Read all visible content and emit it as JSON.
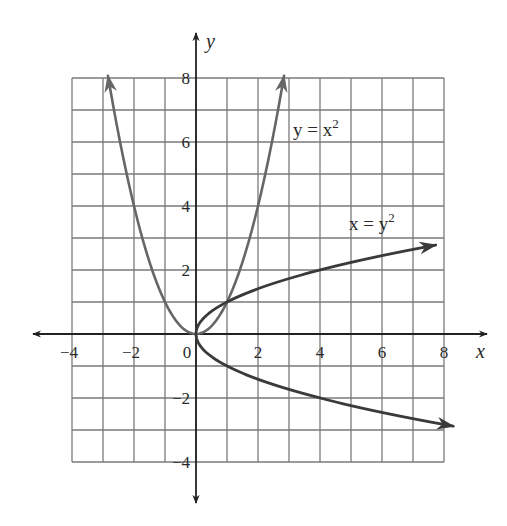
{
  "chart_data": {
    "type": "line",
    "title": "",
    "xlabel": "x",
    "ylabel": "y",
    "xlim": [
      -4,
      8
    ],
    "ylim": [
      -4,
      8
    ],
    "grid": true,
    "grid_step": 1,
    "x_ticks": [
      -4,
      -2,
      0,
      2,
      4,
      6,
      8
    ],
    "x_tick_labels": [
      "−4",
      "−2",
      "0",
      "2",
      "4",
      "6",
      "8"
    ],
    "y_ticks": [
      -4,
      -2,
      2,
      4,
      6,
      8
    ],
    "y_tick_labels": [
      "−4",
      "−2",
      "2",
      "4",
      "6",
      "8"
    ],
    "series": [
      {
        "name": "y = x^2",
        "label_main": "y = x",
        "label_sup": "2",
        "param": "x",
        "domain": [
          -2.84,
          2.84
        ],
        "color": "#666666",
        "arrows": "both-ends",
        "sample_points": [
          [
            -2.84,
            8.07
          ],
          [
            -2,
            4
          ],
          [
            -1,
            1
          ],
          [
            0,
            0
          ],
          [
            1,
            1
          ],
          [
            2,
            4
          ],
          [
            2.84,
            8.07
          ]
        ]
      },
      {
        "name": "x = y^2",
        "label_main": "x = y",
        "label_sup": "2",
        "param": "y",
        "domain": [
          -2.88,
          2.78
        ],
        "color": "#3a3a3a",
        "arrows": "both-ends",
        "sample_points": [
          [
            8.29,
            -2.88
          ],
          [
            4,
            -2
          ],
          [
            1,
            -1
          ],
          [
            0,
            0
          ],
          [
            1,
            1
          ],
          [
            4,
            2
          ],
          [
            7.73,
            2.78
          ]
        ]
      }
    ],
    "intersections": [
      [
        0,
        0
      ],
      [
        1,
        1
      ]
    ],
    "legend_position": "inline-labels"
  },
  "colors": {
    "grid": "#7a7a7a",
    "axis": "#222222",
    "background": "#ffffff"
  },
  "labels": {
    "x_axis": "x",
    "y_axis": "y",
    "curve1_main": "y = x",
    "curve1_sup": "2",
    "curve2_main": "x = y",
    "curve2_sup": "2"
  }
}
